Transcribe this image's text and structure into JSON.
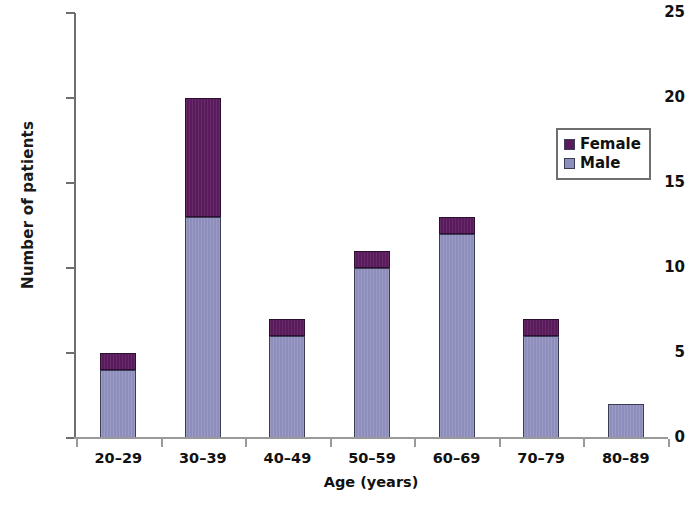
{
  "chart_data": {
    "type": "bar",
    "subtype": "stacked-vertical",
    "title": "",
    "xlabel": "Age (years)",
    "ylabel": "Number of patients",
    "categories": [
      "20–29",
      "30–39",
      "40–49",
      "50–59",
      "60–69",
      "70–79",
      "80–89"
    ],
    "series": [
      {
        "name": "Male",
        "color": "#8e8ebd",
        "values": [
          4,
          13,
          6,
          10,
          12,
          6,
          2
        ]
      },
      {
        "name": "Female",
        "color": "#5a1b5c",
        "values": [
          1,
          7,
          1,
          1,
          1,
          1,
          0
        ]
      }
    ],
    "totals": [
      5,
      20,
      7,
      11,
      13,
      7,
      2
    ],
    "ylim": [
      0,
      25
    ],
    "ytick_labels": [
      "0",
      "5",
      "10",
      "15",
      "20",
      "25"
    ],
    "ytick_values": [
      0,
      5,
      10,
      15,
      20,
      25
    ],
    "grid": false,
    "legend_position": "upper-right",
    "stack_order_bottom_to_top": [
      "Male",
      "Female"
    ]
  },
  "legend": {
    "entries": [
      {
        "label": "Female",
        "color": "#5a1b5c"
      },
      {
        "label": "Male",
        "color": "#8e8ebd"
      }
    ]
  },
  "caption": {
    "sliver_text": ""
  }
}
